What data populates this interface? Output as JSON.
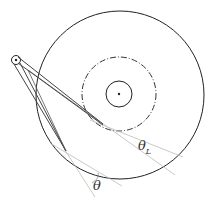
{
  "diagram": {
    "type": "tonearm-geometry",
    "labels": {
      "theta_L": "θ",
      "theta_L_sub": "L",
      "theta": "θ"
    },
    "colors": {
      "stroke": "#222222",
      "guide": "#bbbbbb"
    }
  }
}
